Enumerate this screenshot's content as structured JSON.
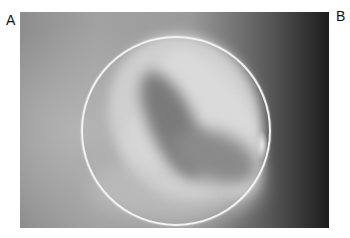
{
  "figure": {
    "panel_labels": [
      "A",
      "B"
    ],
    "photo": {
      "description": "grayscale endoscopic image with a circular ring overlay",
      "colors": {
        "ring": "#f2f2f2",
        "background_light": "#a2a2a2",
        "background_dark": "#1c1c1c"
      }
    }
  }
}
